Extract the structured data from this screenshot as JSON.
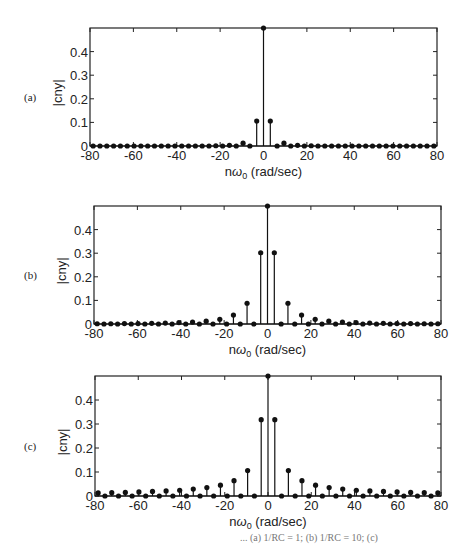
{
  "chart_data": [
    {
      "type": "stem",
      "panel_label": "(a)",
      "xlabel": "nω0 (rad/sec)",
      "ylabel": "|cny|",
      "xlim": [
        -80,
        80
      ],
      "ylim": [
        0,
        0.5
      ],
      "xticks": [
        -80,
        -60,
        -40,
        -20,
        0,
        20,
        40,
        60,
        80
      ],
      "yticks": [
        0,
        0.1,
        0.2,
        0.3,
        0.4
      ],
      "omega0": 3.1416,
      "n_range": [
        -25,
        25
      ],
      "values_by_n": {
        "0": 0.5,
        "1": 0.106,
        "3": 0.012,
        "5": 0.003,
        "7": 0.001,
        "-1": 0.106,
        "-3": 0.012,
        "-5": 0.003,
        "-7": 0.001
      },
      "default_value": 0
    },
    {
      "type": "stem",
      "panel_label": "(b)",
      "xlabel": "nω0 (rad/sec)",
      "ylabel": "|cny|",
      "xlim": [
        -80,
        80
      ],
      "ylim": [
        0,
        0.5
      ],
      "xticks": [
        -80,
        -60,
        -40,
        -20,
        0,
        20,
        40,
        60,
        80
      ],
      "yticks": [
        0,
        0.1,
        0.2,
        0.3,
        0.4
      ],
      "omega0": 3.1416,
      "n_range": [
        -25,
        25
      ],
      "values_by_n": {
        "0": 0.5,
        "1": 0.302,
        "3": 0.088,
        "5": 0.038,
        "7": 0.02,
        "9": 0.012,
        "11": 0.008,
        "13": 0.006,
        "15": 0.004,
        "17": 0.003,
        "19": 0.002,
        "21": 0.002,
        "23": 0.001,
        "25": 0.001,
        "-1": 0.302,
        "-3": 0.088,
        "-5": 0.038,
        "-7": 0.02,
        "-9": 0.012,
        "-11": 0.008,
        "-13": 0.006,
        "-15": 0.004,
        "-17": 0.003,
        "-19": 0.002,
        "-21": 0.002,
        "-23": 0.001,
        "-25": 0.001
      },
      "default_value": 0
    },
    {
      "type": "stem",
      "panel_label": "(c)",
      "xlabel": "nω0 (rad/sec)",
      "ylabel": "|cny|",
      "xlim": [
        -80,
        80
      ],
      "ylim": [
        0,
        0.5
      ],
      "xticks": [
        -80,
        -60,
        -40,
        -20,
        0,
        20,
        40,
        60,
        80
      ],
      "yticks": [
        0,
        0.1,
        0.2,
        0.3,
        0.4
      ],
      "omega0": 3.1416,
      "n_range": [
        -25,
        25
      ],
      "values_by_n": {
        "0": 0.5,
        "1": 0.318,
        "3": 0.106,
        "5": 0.064,
        "7": 0.045,
        "9": 0.035,
        "11": 0.029,
        "13": 0.024,
        "15": 0.021,
        "17": 0.019,
        "19": 0.017,
        "21": 0.015,
        "23": 0.014,
        "25": 0.013,
        "-1": 0.318,
        "-3": 0.106,
        "-5": 0.064,
        "-7": 0.045,
        "-9": 0.035,
        "-11": 0.029,
        "-13": 0.024,
        "-15": 0.021,
        "-17": 0.019,
        "-19": 0.017,
        "-21": 0.015,
        "-23": 0.014,
        "-25": 0.013
      },
      "default_value": 0
    }
  ],
  "panels": [
    {
      "label": "(a)",
      "frame": {
        "x": 90,
        "y": 28,
        "w": 347,
        "h": 118
      }
    },
    {
      "label": "(b)",
      "frame": {
        "x": 94,
        "y": 206,
        "w": 347,
        "h": 118
      }
    },
    {
      "label": "(c)",
      "frame": {
        "x": 95,
        "y": 376,
        "w": 346,
        "h": 120
      }
    }
  ],
  "caption": "... (a) 1/RC = 1; (b) 1/RC = 10; (c)"
}
